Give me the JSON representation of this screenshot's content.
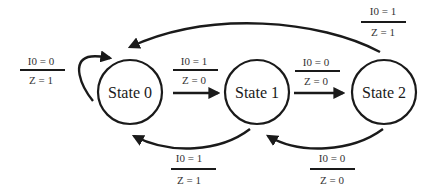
{
  "diagram": {
    "type": "finite-state-machine",
    "states": [
      {
        "id": "s0",
        "label": "State 0"
      },
      {
        "id": "s1",
        "label": "State 1"
      },
      {
        "id": "s2",
        "label": "State 2"
      }
    ],
    "transitions": [
      {
        "id": "t_s0_s0",
        "from": "State 0",
        "to": "State 0",
        "input": "I0 = 0",
        "output": "Z = 1"
      },
      {
        "id": "t_s0_s1",
        "from": "State 0",
        "to": "State 1",
        "input": "I0 = 1",
        "output": "Z = 0"
      },
      {
        "id": "t_s1_s2",
        "from": "State 1",
        "to": "State 2",
        "input": "I0 = 0",
        "output": "Z = 0"
      },
      {
        "id": "t_s2_s0",
        "from": "State 2",
        "to": "State 0",
        "input": "I0 = 1",
        "output": "Z = 1"
      },
      {
        "id": "t_s1_s0",
        "from": "State 1",
        "to": "State 0",
        "input": "I0 = 1",
        "output": "Z = 1"
      },
      {
        "id": "t_s2_s1",
        "from": "State 2",
        "to": "State 1",
        "input": "I0 = 0",
        "output": "Z = 0"
      }
    ],
    "colors": {
      "stroke": "#1a1a1a",
      "text": "#333333",
      "background": "#ffffff"
    }
  }
}
